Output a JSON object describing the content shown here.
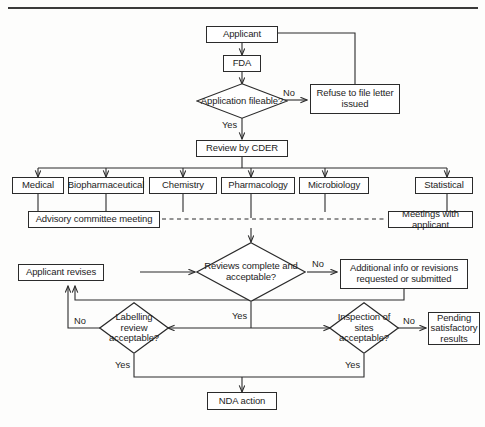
{
  "figure": {
    "kind": "flowchart"
  },
  "nodes": {
    "applicant": "Applicant",
    "fda": "FDA",
    "application_fileable": "Application fileable?",
    "refuse_to_file": "Refuse to file letter issued",
    "review_by_cder": "Review by CDER",
    "disciplines": [
      "Medical",
      "Biopharmaceutical",
      "Chemistry",
      "Pharmacology",
      "Microbiology",
      "Statistical"
    ],
    "advisory_committee_meeting": "Advisory committee meeting",
    "meetings_with_applicant": "Meetings with applicant",
    "reviews_complete": "Reviews complete and acceptable?",
    "additional_info": "Additional info or revisions requested or submitted",
    "applicant_revises": "Applicant revises",
    "labelling_review": "Labelling review acceptable?",
    "inspection_of_sites": "Inspection of sites acceptable?",
    "pending_results": "Pending satisfactory results",
    "nda_action": "NDA action"
  },
  "edge_labels": {
    "fileable_no": "No",
    "fileable_yes": "Yes",
    "reviews_no": "No",
    "reviews_yes": "Yes",
    "labelling_no": "No",
    "labelling_yes": "Yes",
    "inspection_no": "No",
    "inspection_yes": "Yes"
  },
  "style": {
    "line_color": "#2b2b2b",
    "text_color": "#1d1d1d",
    "background": "#fdfdfc",
    "rule_color": "#3a3a3a"
  }
}
